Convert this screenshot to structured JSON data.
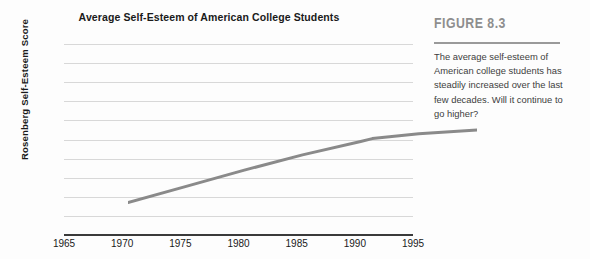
{
  "chart_data": {
    "type": "line",
    "title": "Average Self-Esteem of American College Students",
    "xlabel": "",
    "ylabel": "Rosenberg Self-Esteem Score",
    "xlim": [
      1965,
      1995
    ],
    "ylim": [
      25,
      35
    ],
    "yticks": [
      35,
      34,
      33,
      32,
      31,
      30,
      29,
      28,
      27,
      26,
      25
    ],
    "xticks": [
      1965,
      1970,
      1975,
      1980,
      1985,
      1990,
      1995
    ],
    "grid": true,
    "legend": false,
    "line_color": "#8a8a8a",
    "series": [
      {
        "name": "Average self-esteem",
        "x": [
          1965,
          1970,
          1975,
          1980,
          1985,
          1986,
          1990,
          1995
        ],
        "values": [
          29.0,
          29.85,
          30.7,
          31.5,
          32.2,
          32.35,
          32.6,
          32.8
        ]
      }
    ]
  },
  "figure": {
    "label": "FIGURE 8.3",
    "caption": "The average self-esteem of American college students has steadily increased over the last few decades. Will it continue to go higher?"
  }
}
